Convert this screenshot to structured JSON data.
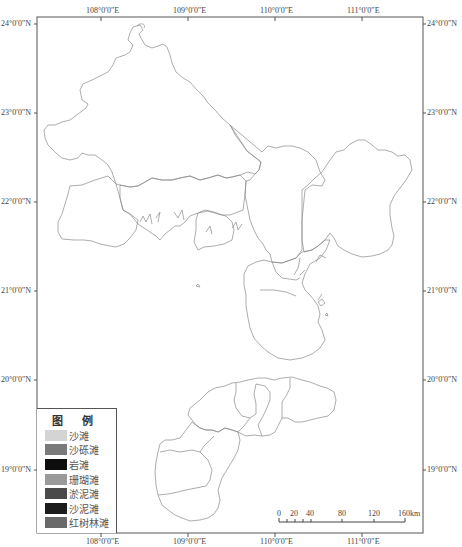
{
  "map": {
    "frame": {
      "left": 37,
      "top": 17,
      "right": 423,
      "bottom": 533
    },
    "longitude_ticks": [
      {
        "label": "108°0′0″E",
        "x": 101
      },
      {
        "label": "109°0′0″E",
        "x": 188
      },
      {
        "label": "110°0′0″E",
        "x": 275
      },
      {
        "label": "111°0′0″E",
        "x": 362
      }
    ],
    "latitude_ticks": [
      {
        "label": "24°0′0″N",
        "y": 24
      },
      {
        "label": "23°0′0″N",
        "y": 113
      },
      {
        "label": "22°0′0″N",
        "y": 202
      },
      {
        "label": "21°0′0″N",
        "y": 291
      },
      {
        "label": "20°0′0″N",
        "y": 380
      },
      {
        "label": "19°0′0″N",
        "y": 470
      }
    ],
    "outline_color": "#8a8a8a",
    "frame_color": "#555555"
  },
  "legend": {
    "title": "图 例",
    "items": [
      {
        "label": "沙滩",
        "color": "#d4d4d4"
      },
      {
        "label": "沙砾滩",
        "color": "#7a7a7a"
      },
      {
        "label": "岩滩",
        "color": "#0d0d0d"
      },
      {
        "label": "珊瑚滩",
        "color": "#9a9a9a"
      },
      {
        "label": "淤泥滩",
        "color": "#4a4a4a"
      },
      {
        "label": "沙泥滩",
        "color": "#1c1c1c"
      },
      {
        "label": "红树林滩",
        "color": "#6a6a6a"
      }
    ]
  },
  "scale_bar": {
    "labels": [
      "0",
      "20",
      "40",
      "80",
      "120",
      "160km"
    ],
    "unit": "km"
  }
}
